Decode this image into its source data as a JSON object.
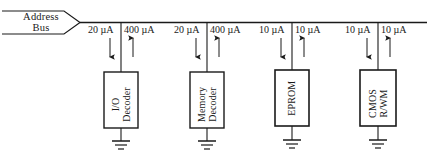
{
  "figure": {
    "type": "circuit-diagram",
    "bus": {
      "name": "address-bus",
      "label_line1": "Address",
      "label_line2": "Bus"
    },
    "units": "µA",
    "branches": [
      {
        "id": "io-decoder",
        "block_line1": "I/O",
        "block_line2": "Decoder",
        "left_current": "20 µA",
        "left_direction": "down",
        "right_current": "400 µA",
        "right_direction": "up",
        "ground": true
      },
      {
        "id": "memory-decoder",
        "block_line1": "Memory",
        "block_line2": "Decoder",
        "left_current": "20 µA",
        "left_direction": "down",
        "right_current": "400 µA",
        "right_direction": "up",
        "ground": true
      },
      {
        "id": "eprom",
        "block_line1": "EPROM",
        "block_line2": "",
        "left_current": "10 µA",
        "left_direction": "down",
        "right_current": "10 µA",
        "right_direction": "up",
        "ground": true
      },
      {
        "id": "cmos-rwm",
        "block_line1": "CMOS",
        "block_line2": "R/WM",
        "left_current": "10 µA",
        "left_direction": "down",
        "right_current": "10 µA",
        "right_direction": "up",
        "ground": true
      }
    ],
    "colors": {
      "line": "#1a1a1a",
      "background": "#ffffff",
      "text": "#1a1a1a"
    }
  }
}
